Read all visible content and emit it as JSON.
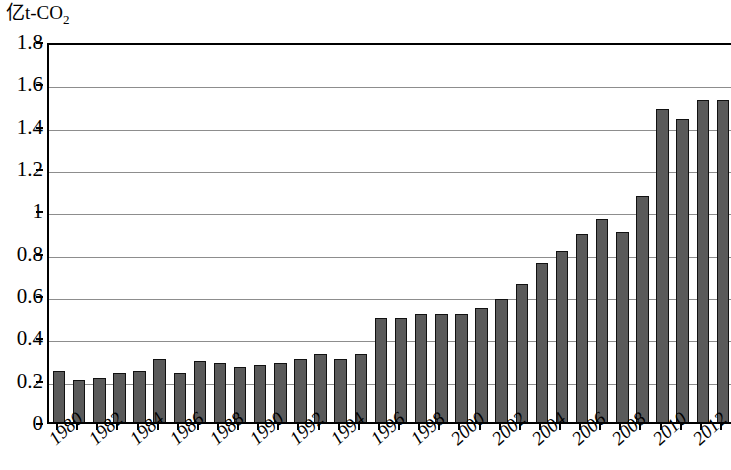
{
  "chart_data": {
    "type": "bar",
    "title": "亿t-CO2",
    "title_main": "亿t-CO",
    "title_sub": "2",
    "xlabel": "",
    "ylabel": "亿t-CO2",
    "ylim": [
      0,
      1.8
    ],
    "ytick_step": 0.2,
    "yticks": [
      "1.8",
      "1.6",
      "1.4",
      "1.2",
      "1",
      "0.8",
      "0.6",
      "0.4",
      "0.2",
      "0"
    ],
    "ytick_values": [
      1.8,
      1.6,
      1.4,
      1.2,
      1.0,
      0.8,
      0.6,
      0.4,
      0.2,
      0
    ],
    "grid": true,
    "grid_axis": "y",
    "legend": null,
    "legend_position": "none",
    "bar_color": "#5a5a5a",
    "bar_border_color": "#111111",
    "axis_color": "#000000",
    "gridline_color": "#8d8d8d",
    "xtick_labels_shown": [
      "1980",
      "1982",
      "1984",
      "1986",
      "1988",
      "1990",
      "1992",
      "1994",
      "1996",
      "1998",
      "2000",
      "2002",
      "2004",
      "2006",
      "2008",
      "2010",
      "2012"
    ],
    "xtick_label_rotation": -42,
    "categories": [
      "1980",
      "1981",
      "1982",
      "1983",
      "1984",
      "1985",
      "1986",
      "1987",
      "1988",
      "1989",
      "1990",
      "1991",
      "1992",
      "1993",
      "1994",
      "1995",
      "1996",
      "1997",
      "1998",
      "1999",
      "2000",
      "2001",
      "2002",
      "2003",
      "2004",
      "2005",
      "2006",
      "2007",
      "2008",
      "2009",
      "2010",
      "2011",
      "2012",
      "2013"
    ],
    "values": [
      0.24,
      0.2,
      0.21,
      0.23,
      0.24,
      0.3,
      0.23,
      0.29,
      0.28,
      0.26,
      0.27,
      0.28,
      0.3,
      0.32,
      0.3,
      0.32,
      0.49,
      0.49,
      0.51,
      0.51,
      0.51,
      0.54,
      0.58,
      0.65,
      0.75,
      0.81,
      0.89,
      0.96,
      0.9,
      1.07,
      1.48,
      1.43,
      1.52,
      1.52
    ]
  }
}
